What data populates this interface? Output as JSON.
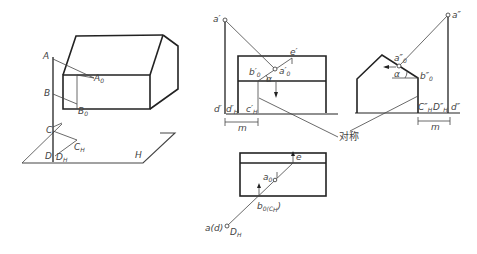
{
  "figure": {
    "type": "technical-projection-diagram",
    "panels": [
      {
        "name": "axonometric-view",
        "labels": {
          "A": "A",
          "A0": "A0",
          "B": "B",
          "B0": "B0",
          "C": "C",
          "CH": "CH",
          "D": "D",
          "DH": "DH",
          "H": "H"
        }
      },
      {
        "name": "front-view",
        "labels": {
          "a1": "a′",
          "a0p": "a′0",
          "b0p": "b′0",
          "ep": "e′",
          "alpha": "α",
          "dp": "d′",
          "dHp": "d′H",
          "cHp": "c′H",
          "m": "m"
        }
      },
      {
        "name": "side-view",
        "labels": {
          "a2": "a″",
          "a0pp": "a″0",
          "b0pp": "b″0",
          "alpha": "α",
          "CHpp": "C″H",
          "DHpp": "D″H",
          "dpp": "d″",
          "m": "m"
        }
      },
      {
        "name": "top-view",
        "labels": {
          "e": "e",
          "a0": "a0",
          "b0cH": "b0(CH)",
          "ad": "a(d)",
          "DH": "DH"
        }
      }
    ],
    "annotation": "对称"
  },
  "text": {
    "A": "A",
    "A0": "A",
    "A0sub": "0",
    "B": "B",
    "B0": "B",
    "B0sub": "0",
    "C": "C",
    "CH": "C",
    "CHsub": "H",
    "D": "D",
    "DH": "D",
    "DHsub": "H",
    "H": "H",
    "a1": "a′",
    "a0p": "a′",
    "a0psub": "0",
    "b0p": "b′",
    "b0psub": "0",
    "ep": "e′",
    "alpha": "α",
    "dp": "d′",
    "dHp": "d′",
    "dHpsub": "H",
    "cHp": "c′",
    "cHpsub": "H",
    "m": "m",
    "a2": "a″",
    "a0pp": "a″",
    "a0ppsub": "0",
    "b0pp": "b″",
    "b0ppsub": "0",
    "CHpp": "C″",
    "CHppsub": "H",
    "DHpp": "D″",
    "DHppsub": "H",
    "dpp": "d″",
    "e": "e",
    "a0": "a",
    "a0sub": "0",
    "b0": "b",
    "b0sub": "0(C",
    "b0sub2": "H",
    ")": ")",
    "ad": "a(d)",
    "DHt": "D",
    "DHtsub": "H",
    "sym": "对称"
  }
}
